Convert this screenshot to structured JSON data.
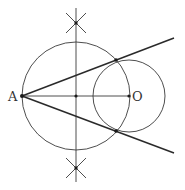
{
  "diagram": {
    "labels": {
      "A": "A",
      "O": "O"
    },
    "points": {
      "A": {
        "x": 22,
        "y": 96
      },
      "M": {
        "x": 76,
        "y": 96
      },
      "O": {
        "x": 129,
        "y": 96
      },
      "T1": {
        "x": 116,
        "y": 60
      },
      "T2": {
        "x": 116,
        "y": 131
      },
      "arcTop": {
        "x": 76,
        "y": 23
      },
      "arcBottom": {
        "x": 76,
        "y": 168
      }
    },
    "circles": [
      {
        "name": "circle-on-AO",
        "cx": 76,
        "cy": 96,
        "r": 54
      },
      {
        "name": "circle-O",
        "cx": 129,
        "cy": 96,
        "r": 36
      }
    ],
    "lines": [
      {
        "name": "segment-AO",
        "from": "A",
        "to": "O"
      },
      {
        "name": "perpendicular-bisector",
        "x": 76,
        "y1": 8,
        "y2": 182
      },
      {
        "name": "tangent-upper",
        "from": "A",
        "through": "T1",
        "end": {
          "x": 174,
          "y": 38
        }
      },
      {
        "name": "tangent-lower",
        "from": "A",
        "through": "T2",
        "end": {
          "x": 174,
          "y": 153
        }
      }
    ],
    "colors": {
      "stroke": "#2a2a2a",
      "background": "#ffffff"
    }
  }
}
